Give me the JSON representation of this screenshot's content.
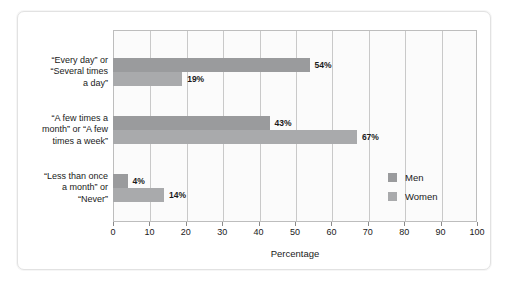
{
  "chart_data": {
    "type": "bar",
    "orientation": "horizontal",
    "title": "",
    "xlabel": "Percentage",
    "ylabel": "",
    "xlim": [
      0,
      100
    ],
    "xticks": [
      0,
      10,
      20,
      30,
      40,
      50,
      60,
      70,
      80,
      90,
      100
    ],
    "xticklabels": [
      "0",
      "10",
      "20",
      "30",
      "40",
      "50",
      "60",
      "70",
      "80",
      "90",
      "100"
    ],
    "grid": true,
    "grid_axis": "x",
    "legend_position": "right-inside",
    "categories": [
      "“Every day” or “Several times a day”",
      "“A few times a month” or “A few times a week”",
      "“Less than once a month” or “Never”"
    ],
    "category_lines": [
      [
        "“Every day” or",
        "“Several times",
        "a day”"
      ],
      [
        "“A few times a",
        "month” or “A few",
        "times a week”"
      ],
      [
        "“Less than once",
        "a month” or",
        "“Never”"
      ]
    ],
    "series": [
      {
        "name": "Men",
        "color": "#9a9b9d",
        "values": [
          54,
          43,
          4
        ],
        "value_labels": [
          "54%",
          "43%",
          "4%"
        ]
      },
      {
        "name": "Women",
        "color": "#a9aaac",
        "values": [
          19,
          67,
          14
        ],
        "value_labels": [
          "19%",
          "67%",
          "14%"
        ]
      }
    ]
  },
  "legend": {
    "items": [
      {
        "label": "Men"
      },
      {
        "label": "Women"
      }
    ]
  },
  "axis": {
    "x_title": "Percentage"
  },
  "colors": {
    "men_bar": "#9a9b9d",
    "women_bar": "#a9aaac",
    "plot_border": "#bdbdbd",
    "gridline": "#c9c9c9",
    "frame": "#e2e2e2",
    "background": "#ffffff"
  }
}
